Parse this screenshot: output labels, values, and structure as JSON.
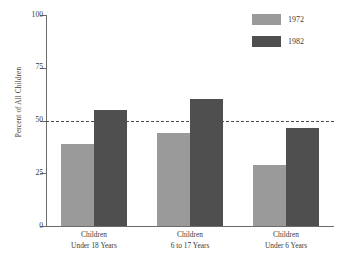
{
  "chart_data": {
    "type": "bar",
    "title": "",
    "xlabel": "",
    "ylabel": "Percent of All Children",
    "categories": [
      "Children Under 18 Years",
      "Children 6 to 17 Years",
      "Children Under 6 Years"
    ],
    "category_lines": [
      [
        "Children",
        "Under 18 Years"
      ],
      [
        "Children",
        "6 to 17 Years"
      ],
      [
        "Children",
        "Under 6 Years"
      ]
    ],
    "series": [
      {
        "name": "1972",
        "color": "#9a9a9a",
        "values": [
          39,
          44,
          29
        ]
      },
      {
        "name": "1982",
        "color": "#4f4f4f",
        "values": [
          55,
          60,
          46.5
        ]
      }
    ],
    "ylim": [
      0,
      100
    ],
    "yticks": [
      0,
      25,
      50,
      75,
      100
    ],
    "ytick_labels": [
      "0",
      "25",
      "50",
      "75",
      "100"
    ],
    "grid": false,
    "reference_line": {
      "value": 50,
      "style": "dashed",
      "color": "#4a4a4a"
    },
    "legend": {
      "position": "top-right",
      "entries": [
        {
          "label": "1972",
          "color": "#9a9a9a"
        },
        {
          "label": "1982",
          "color": "#4f4f4f"
        }
      ]
    }
  }
}
